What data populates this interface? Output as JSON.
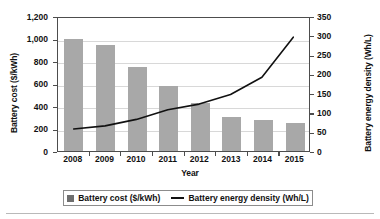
{
  "chart_data": {
    "type": "bar",
    "title": "",
    "subtitle": "",
    "xlabel": "Year",
    "ylabel": "Battery cost ($/kWh)",
    "y2label": "Battery energy density (Wh/L)",
    "categories": [
      "2008",
      "2009",
      "2010",
      "2011",
      "2012",
      "2013",
      "2014",
      "2015"
    ],
    "ylim": [
      0,
      1200
    ],
    "y2lim": [
      0,
      350
    ],
    "yticks": [
      "0",
      "200",
      "400",
      "600",
      "800",
      "1,000",
      "1,200"
    ],
    "ytick_values": [
      0,
      200,
      400,
      600,
      800,
      1000,
      1200
    ],
    "y2ticks": [
      "0",
      "50",
      "100",
      "150",
      "200",
      "250",
      "300",
      "350"
    ],
    "y2tick_values": [
      0,
      50,
      100,
      150,
      200,
      250,
      300,
      350
    ],
    "grid": true,
    "legend_position": "bottom",
    "series": [
      {
        "name": "Battery cost ($/kWh)",
        "type": "bar",
        "axis": "left",
        "color": "#a8a8a8",
        "values": [
          1000,
          940,
          750,
          580,
          430,
          300,
          275,
          250
        ]
      },
      {
        "name": "Battery energy density (Wh/L)",
        "type": "line",
        "axis": "right",
        "color": "#111111",
        "values": [
          60,
          68,
          85,
          110,
          125,
          150,
          195,
          300
        ]
      }
    ]
  },
  "legend": {
    "items": [
      {
        "label": "Battery cost ($/kWh)",
        "marker": "square-marker"
      },
      {
        "label": "Battery energy density (Wh/L)",
        "marker": "line-marker"
      }
    ]
  }
}
